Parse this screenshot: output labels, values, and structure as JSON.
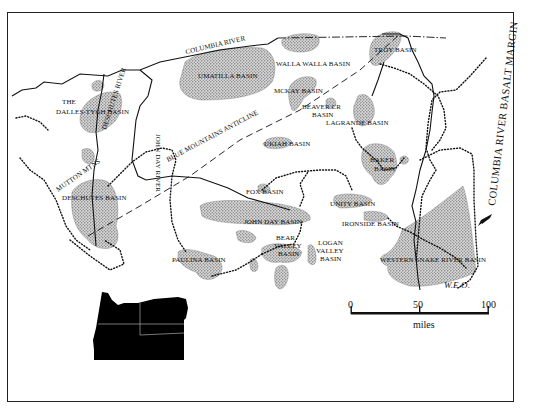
{
  "figure": {
    "top_cut_text": "...pp...",
    "frame": {
      "x": 7,
      "y": 12,
      "width": 507,
      "height": 390
    }
  },
  "labels": {
    "columbia_river": "COLUMBIA RIVER",
    "walla_walla_basin": "WALLA WALLA BASIN",
    "troy_basin": "TROY BASIN",
    "umatilla_basin": "UMATILLA BASIN",
    "the_dalles_line1": "THE",
    "the_dalles_line2": "DALLES-TYGH BASIN",
    "mckay_basin": "MCKAY BASIN",
    "beaver_cr_line1": "BEAVER CR",
    "beaver_cr_line2": "BASIN",
    "lagrande_basin": "LAGRANDE BASIN",
    "deschutes_river": "DESCHUTES RIVER",
    "john_day_river": "JOHN DAY RIVER",
    "blue_mountains_anticline": "BLUE MOUNTAINS ANTICLINE",
    "ukiah_basin": "UKIAH BASIN",
    "baker_line1": "BAKER",
    "baker_line2": "BASIN",
    "columbia_river_basalt_margin": "COLUMBIA RIVER BASALT MARGIN",
    "mutton_mtns": "MUTTON MTNS",
    "deschutes_basin": "DESCHUTES BASIN",
    "fox_basin": "FOX BASIN",
    "john_day_basin": "JOHN DAY BASIN",
    "unity_basin": "UNITY BASIN",
    "ironside_basin": "IRONSIDE BASIN",
    "bear_valley_line1": "BEAR",
    "bear_valley_line2": "VALLEY",
    "bear_valley_line3": "BASIN",
    "logan_valley_line1": "LOGAN",
    "logan_valley_line2": "VALLEY",
    "logan_valley_line3": "BASIN",
    "paulina_basin": "PAULINA BASIN",
    "western_snake_river_basin": "WESTERN SNAKE RIVER BASIN",
    "initials": "W.E.O."
  },
  "scale_bar": {
    "ticks": [
      "0",
      "50",
      "100"
    ],
    "unit": "miles"
  },
  "inset": {
    "name": "Oregon locator map"
  },
  "colors": {
    "ink": "#111111",
    "stipple": "#8a8a8a",
    "background": "#ffffff"
  }
}
